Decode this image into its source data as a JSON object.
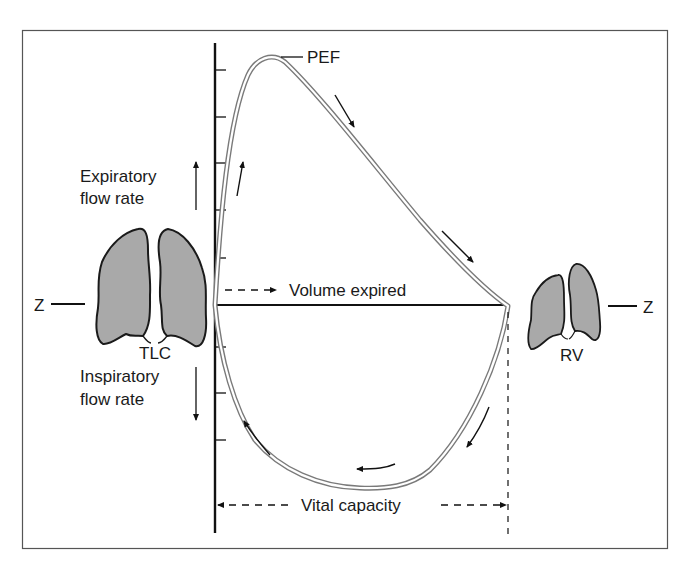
{
  "diagram": {
    "labels": {
      "pef": "PEF",
      "expiratory_line1": "Expiratory",
      "expiratory_line2": "flow rate",
      "inspiratory_line1": "Inspiratory",
      "inspiratory_line2": "flow rate",
      "volume_expired": "Volume expired",
      "vital_capacity": "Vital capacity",
      "tlc": "TLC",
      "rv": "RV",
      "z_left": "Z",
      "z_right": "Z"
    },
    "colors": {
      "frame": "#555555",
      "axis": "#111111",
      "loop_outline": "#777777",
      "lung_fill": "#a9a9a9",
      "lung_outline": "#1a1a1a",
      "text": "#1a1a1a",
      "background": "#ffffff"
    },
    "axis": {
      "upper_tick_count": 5,
      "lower_tick_count": 3
    },
    "annotations": {
      "left_lungs": "lungs-at-total-lung-capacity",
      "right_lungs": "lungs-at-residual-volume",
      "loop_direction": "clockwise: expiration from TLC up to PEF, down to RV, inspiration back along lower limb"
    }
  }
}
